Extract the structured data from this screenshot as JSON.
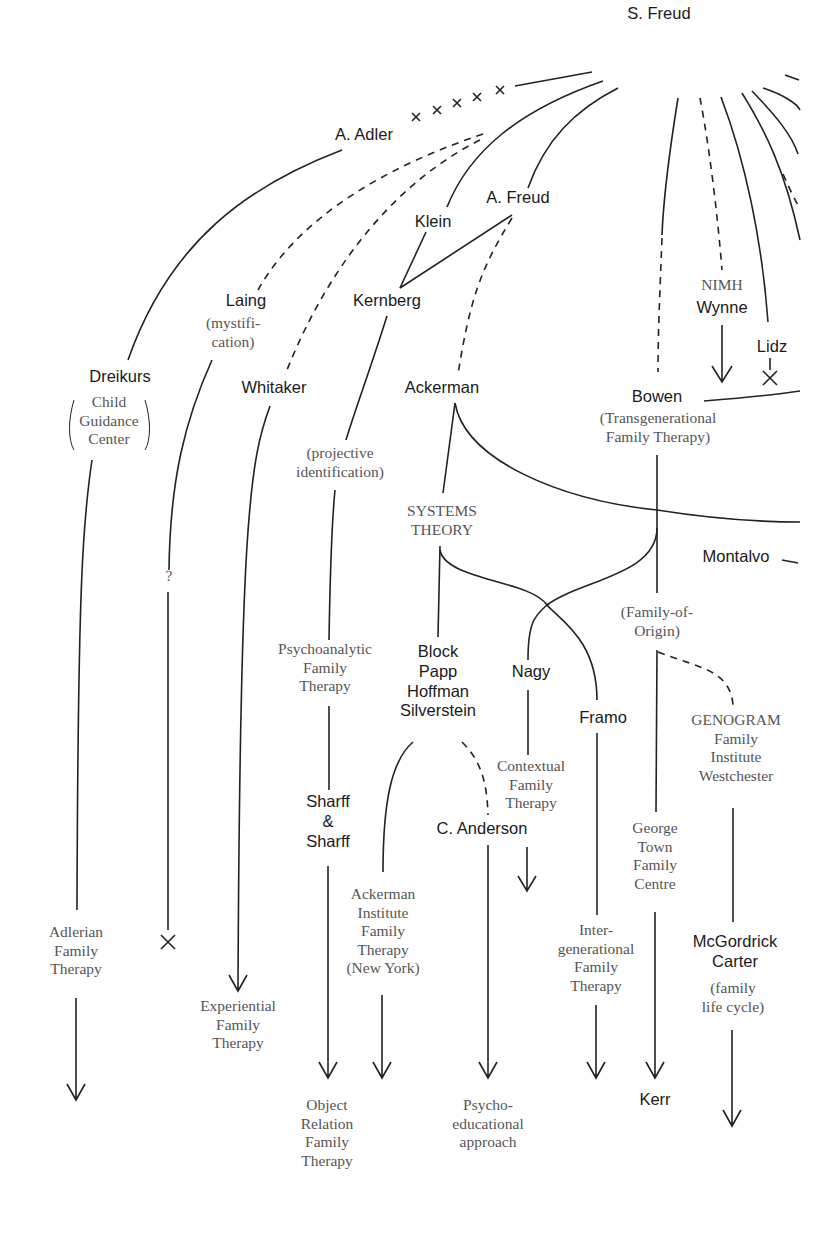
{
  "diagram": {
    "type": "lineage-tree",
    "title": "",
    "root": "S. Freud",
    "nodes": {
      "s_freud": "S. Freud",
      "a_adler": "A. Adler",
      "a_freud": "A. Freud",
      "klein": "Klein",
      "laing": "Laing",
      "laing_note": "(mystifi-\ncation)",
      "kernberg": "Kernberg",
      "nimh": "NIMH",
      "wynne": "Wynne",
      "lidz": "Lidz",
      "dreikurs": "Dreikurs",
      "child_guidance": "Child\nGuidance\nCenter",
      "whitaker": "Whitaker",
      "ackerman": "Ackerman",
      "bowen": "Bowen",
      "bowen_note": "(Transgenerational\nFamily Therapy)",
      "projective": "(projective\nidentification)",
      "systems_theory": "SYSTEMS\nTHEORY",
      "montalvo": "Montalvo",
      "family_of_origin": "(Family-of-\nOrigin)",
      "question": "?",
      "psychoanalytic_ft": "Psychoanalytic\nFamily\nTherapy",
      "block_group": "Block\nPapp\nHoffman\nSilverstein",
      "nagy": "Nagy",
      "framo": "Framo",
      "genogram": "GENOGRAM\nFamily\nInstitute\nWestchester",
      "contextual_ft": "Contextual\nFamily\nTherapy",
      "sharff": "Sharff\n&\nSharff",
      "c_anderson": "C. Anderson",
      "george_town": "George\nTown\nFamily\nCentre",
      "adlerian_ft": "Adlerian\nFamily\nTherapy",
      "ackerman_institute": "Ackerman\nInstitute\nFamily\nTherapy\n(New York)",
      "intergenerational_ft": "Inter-\ngenerational\nFamily\nTherapy",
      "mcgoldrick": "McGordrick\nCarter",
      "mcgoldrick_note": "(family\nlife cycle)",
      "experiential_ft": "Experiential\nFamily\nTherapy",
      "kerr": "Kerr",
      "object_relation_ft": "Object\nRelation\nFamily\nTherapy",
      "psychoeducational": "Psycho-\neducational\napproach"
    },
    "edges": [
      {
        "from": "S. Freud",
        "to": "A. Adler",
        "style": "broken (x-marks)"
      },
      {
        "from": "S. Freud",
        "to": "Klein",
        "style": "solid"
      },
      {
        "from": "S. Freud",
        "to": "A. Freud",
        "style": "solid"
      },
      {
        "from": "S. Freud",
        "to": "Laing",
        "style": "dashed"
      },
      {
        "from": "S. Freud",
        "to": "Whitaker",
        "style": "dashed"
      },
      {
        "from": "S. Freud",
        "to": "Bowen",
        "style": "solid-then-dashed"
      },
      {
        "from": "S. Freud",
        "to": "NIMH / Wynne",
        "style": "dashed"
      },
      {
        "from": "S. Freud",
        "to": "Lidz",
        "style": "solid"
      },
      {
        "from": "A. Adler",
        "to": "Dreikurs",
        "style": "solid"
      },
      {
        "from": "Klein",
        "to": "Kernberg",
        "style": "solid"
      },
      {
        "from": "A. Freud",
        "to": "Kernberg",
        "style": "solid"
      },
      {
        "from": "A. Freud",
        "to": "Ackerman",
        "style": "dashed"
      },
      {
        "from": "Dreikurs",
        "to": "Adlerian Family Therapy",
        "style": "arrow"
      },
      {
        "from": "Laing",
        "to": "?",
        "style": "ends with X"
      },
      {
        "from": "Whitaker",
        "to": "Experiential Family Therapy",
        "style": "arrow"
      },
      {
        "from": "Kernberg",
        "to": "Psychoanalytic Family Therapy",
        "style": "solid"
      },
      {
        "from": "Psychoanalytic Family Therapy",
        "to": "Sharff & Sharff",
        "style": "solid"
      },
      {
        "from": "Sharff & Sharff",
        "to": "Object Relation Family Therapy",
        "style": "arrow"
      },
      {
        "from": "Ackerman",
        "to": "Systems Theory",
        "style": "solid"
      },
      {
        "from": "Ackerman",
        "to": "Montalvo (off-page)",
        "style": "solid"
      },
      {
        "from": "Systems Theory",
        "to": "Block/Papp/Hoffman/Silverstein",
        "style": "solid"
      },
      {
        "from": "Systems Theory",
        "to": "Framo",
        "style": "solid"
      },
      {
        "from": "Bowen",
        "to": "Nagy",
        "style": "solid"
      },
      {
        "from": "Bowen",
        "to": "Family-of-Origin",
        "style": "solid"
      },
      {
        "from": "Block/Papp/Hoffman/Silverstein",
        "to": "Ackerman Institute Family Therapy",
        "style": "arrow"
      },
      {
        "from": "Block/Papp/Hoffman/Silverstein",
        "to": "C. Anderson",
        "style": "dashed"
      },
      {
        "from": "Nagy",
        "to": "Contextual Family Therapy",
        "style": "arrow"
      },
      {
        "from": "C. Anderson",
        "to": "Psycho-educational approach",
        "style": "arrow"
      },
      {
        "from": "Framo",
        "to": "Intergenerational Family Therapy",
        "style": "arrow"
      },
      {
        "from": "Family-of-Origin",
        "to": "George Town Family Centre",
        "style": "solid"
      },
      {
        "from": "George Town Family Centre",
        "to": "Kerr",
        "style": "arrow"
      },
      {
        "from": "Family-of-Origin",
        "to": "GENOGRAM Family Institute Westchester",
        "style": "dashed"
      },
      {
        "from": "GENOGRAM Family Institute Westchester",
        "to": "McGordrick Carter",
        "style": "solid"
      },
      {
        "from": "McGordrick Carter",
        "to": "continuation",
        "style": "arrow"
      },
      {
        "from": "Wynne",
        "to": "continuation",
        "style": "arrow"
      },
      {
        "from": "Lidz",
        "to": "ended",
        "style": "ends with X"
      }
    ]
  }
}
